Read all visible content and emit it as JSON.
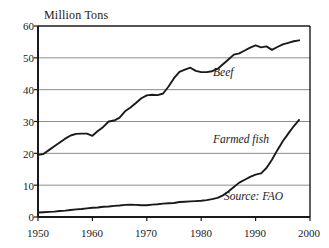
{
  "chart_data": {
    "type": "line",
    "title": "Million Tons",
    "xlabel": "",
    "ylabel": "Million Tons",
    "xlim": [
      1950,
      2000
    ],
    "ylim": [
      0,
      60
    ],
    "yticks": [
      0,
      10,
      20,
      30,
      40,
      50,
      60
    ],
    "xticks": [
      1950,
      1960,
      1970,
      1980,
      1990,
      2000
    ],
    "grid": "horizontal",
    "legend": "inline-annotations",
    "annotations": [
      {
        "text": "Beef",
        "x": 1983,
        "y": 43
      },
      {
        "text": "Farmed fish",
        "x": 1983,
        "y": 22
      },
      {
        "text": "Source: FAO",
        "x": 1986,
        "y": 4.5
      }
    ],
    "series": [
      {
        "name": "Beef",
        "x": [
          1950,
          1951,
          1952,
          1953,
          1954,
          1955,
          1956,
          1957,
          1958,
          1959,
          1960,
          1961,
          1962,
          1963,
          1964,
          1965,
          1966,
          1967,
          1968,
          1969,
          1970,
          1971,
          1972,
          1973,
          1974,
          1975,
          1976,
          1977,
          1978,
          1979,
          1980,
          1981,
          1982,
          1983,
          1984,
          1985,
          1986,
          1987,
          1988,
          1989,
          1990,
          1991,
          1992,
          1993,
          1994,
          1995,
          1996,
          1997,
          1998
        ],
        "values": [
          19.5,
          19.8,
          21.0,
          22.2,
          23.4,
          24.6,
          25.6,
          26.1,
          26.2,
          26.2,
          25.5,
          27.0,
          28.3,
          30.0,
          30.3,
          31.2,
          33.2,
          34.4,
          35.8,
          37.3,
          38.2,
          38.4,
          38.3,
          38.8,
          41.0,
          43.6,
          45.6,
          46.3,
          46.9,
          45.9,
          45.5,
          45.5,
          45.8,
          46.5,
          48.0,
          49.5,
          51.0,
          51.4,
          52.3,
          53.2,
          53.9,
          53.3,
          53.6,
          52.5,
          53.4,
          54.2,
          54.7,
          55.2,
          55.5
        ]
      },
      {
        "name": "Farmed fish",
        "x": [
          1950,
          1951,
          1952,
          1953,
          1954,
          1955,
          1956,
          1957,
          1958,
          1959,
          1960,
          1961,
          1962,
          1963,
          1964,
          1965,
          1966,
          1967,
          1968,
          1969,
          1970,
          1971,
          1972,
          1973,
          1974,
          1975,
          1976,
          1977,
          1978,
          1979,
          1980,
          1981,
          1982,
          1983,
          1984,
          1985,
          1986,
          1987,
          1988,
          1989,
          1990,
          1991,
          1992,
          1993,
          1994,
          1995,
          1996,
          1997,
          1998
        ],
        "values": [
          1.4,
          1.5,
          1.6,
          1.7,
          1.9,
          2.0,
          2.2,
          2.4,
          2.5,
          2.7,
          2.9,
          3.0,
          3.2,
          3.3,
          3.5,
          3.6,
          3.8,
          3.9,
          3.8,
          3.7,
          3.7,
          3.9,
          4.0,
          4.2,
          4.3,
          4.4,
          4.7,
          4.8,
          4.9,
          5.0,
          5.1,
          5.3,
          5.6,
          6.0,
          6.8,
          8.0,
          9.4,
          10.8,
          11.7,
          12.6,
          13.3,
          13.7,
          15.4,
          18.0,
          21.0,
          23.8,
          26.2,
          28.5,
          30.5
        ]
      }
    ],
    "axis": {
      "y_axis_title": "Million Tons",
      "source": "Source: FAO"
    }
  },
  "labels": {
    "title": "Million Tons",
    "series_beef": "Beef",
    "series_fish": "Farmed fish",
    "source": "Source: FAO",
    "yticks": [
      "60",
      "50",
      "40",
      "30",
      "20",
      "10",
      "0"
    ],
    "xticks": [
      "1950",
      "1960",
      "1970",
      "1980",
      "1990",
      "2000"
    ]
  },
  "colors": {
    "line": "#1a1a1a",
    "grid": "#8c8c8c",
    "axis": "#1a1a1a",
    "background": "#ffffff"
  }
}
